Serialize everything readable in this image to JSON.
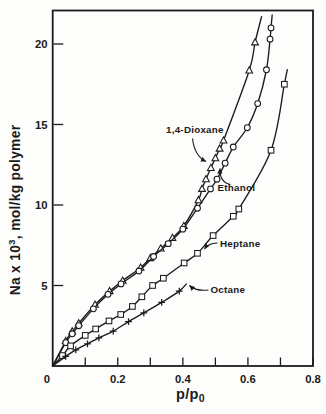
{
  "figure": {
    "background": "#fdfdfc",
    "ink": "#1b1b1b"
  },
  "chart_data": {
    "type": "line",
    "title": "",
    "xlabel": "p/p0",
    "ylabel": "Na x 10^3, mol/kg polymer",
    "xlim": [
      0,
      0.8
    ],
    "ylim": [
      0,
      22.08
    ],
    "grid": false,
    "framed": true,
    "legend_position": "in-plot annotations with arrows",
    "x_axis": {
      "title_base": "p/p",
      "title_sub": "0",
      "zero_label": "0",
      "ticks": [
        {
          "v": 0.1
        },
        {
          "v": 0.2,
          "label": "0.2"
        },
        {
          "v": 0.3
        },
        {
          "v": 0.4,
          "label": "0.4"
        },
        {
          "v": 0.5
        },
        {
          "v": 0.6,
          "label": "0.6"
        },
        {
          "v": 0.7
        },
        {
          "v": 0.8,
          "label": "0.8"
        }
      ]
    },
    "y_axis": {
      "title_base": "Na x 10",
      "title_sup": "3",
      "title_rest": ", mol/kg polymer",
      "ticks": [
        {
          "v": 5,
          "label": "5"
        },
        {
          "v": 10,
          "label": "10"
        },
        {
          "v": 15,
          "label": "15"
        },
        {
          "v": 20,
          "label": "20"
        }
      ]
    },
    "series": [
      {
        "name": "1,4-Dioxane",
        "marker": "triangle",
        "curve_start": [
          0,
          0
        ],
        "curve_end": [
          0.642,
          21.7
        ],
        "points": [
          [
            0.04,
            1.55
          ],
          [
            0.06,
            2.15
          ],
          [
            0.08,
            2.65
          ],
          [
            0.13,
            3.8
          ],
          [
            0.175,
            4.65
          ],
          [
            0.215,
            5.3
          ],
          [
            0.27,
            6.1
          ],
          [
            0.3,
            6.7
          ],
          [
            0.332,
            7.3
          ],
          [
            0.368,
            7.95
          ],
          [
            0.403,
            8.7
          ],
          [
            0.448,
            10.3
          ],
          [
            0.459,
            11.0
          ],
          [
            0.471,
            11.6
          ],
          [
            0.486,
            12.3
          ],
          [
            0.5,
            12.9
          ],
          [
            0.513,
            13.5
          ],
          [
            0.525,
            14.0
          ],
          [
            0.604,
            18.35
          ],
          [
            0.622,
            20.1
          ]
        ]
      },
      {
        "name": "Ethanol",
        "marker": "circle",
        "curve_start": [
          0,
          0
        ],
        "curve_end": [
          0.6745,
          21.8
        ],
        "points": [
          [
            0.04,
            1.45
          ],
          [
            0.06,
            2.0
          ],
          [
            0.08,
            2.5
          ],
          [
            0.125,
            3.55
          ],
          [
            0.17,
            4.45
          ],
          [
            0.21,
            5.1
          ],
          [
            0.265,
            5.9
          ],
          [
            0.31,
            6.8
          ],
          [
            0.355,
            7.6
          ],
          [
            0.4,
            8.5
          ],
          [
            0.445,
            9.8
          ],
          [
            0.485,
            11.0
          ],
          [
            0.505,
            11.6
          ],
          [
            0.53,
            12.6
          ],
          [
            0.555,
            13.6
          ],
          [
            0.598,
            14.8
          ],
          [
            0.63,
            16.3
          ],
          [
            0.657,
            18.4
          ],
          [
            0.668,
            20.3
          ],
          [
            0.671,
            21.0
          ]
        ]
      },
      {
        "name": "Heptane",
        "marker": "square",
        "curve_start": [
          0,
          0
        ],
        "curve_end": [
          0.721,
          18.4
        ],
        "points": [
          [
            0.03,
            0.65
          ],
          [
            0.055,
            1.25
          ],
          [
            0.1,
            1.9
          ],
          [
            0.132,
            2.3
          ],
          [
            0.173,
            2.8
          ],
          [
            0.209,
            3.2
          ],
          [
            0.245,
            3.7
          ],
          [
            0.274,
            4.3
          ],
          [
            0.307,
            5.0
          ],
          [
            0.34,
            5.45
          ],
          [
            0.404,
            6.4
          ],
          [
            0.445,
            7.0
          ],
          [
            0.493,
            8.1
          ],
          [
            0.555,
            9.3
          ],
          [
            0.572,
            9.75
          ],
          [
            0.671,
            13.4
          ],
          [
            0.712,
            17.5
          ]
        ]
      },
      {
        "name": "Octane",
        "marker": "plus",
        "curve_start": [
          0,
          0
        ],
        "curve_end": [
          0.411,
          5.1
        ],
        "points": [
          [
            0.04,
            0.6
          ],
          [
            0.071,
            1.0
          ],
          [
            0.107,
            1.38
          ],
          [
            0.142,
            1.75
          ],
          [
            0.186,
            2.17
          ],
          [
            0.233,
            2.76
          ],
          [
            0.28,
            3.3
          ],
          [
            0.335,
            3.95
          ],
          [
            0.389,
            4.65
          ]
        ]
      }
    ],
    "annotations": [
      {
        "text": "1,4-Dioxane",
        "x": 166,
        "y": 133,
        "arrow": {
          "from": [
            192.5,
            138.5
          ],
          "ctrl": [
            194.5,
            156
          ],
          "to": [
            206,
            161.5
          ]
        }
      },
      {
        "text": "Ethanol",
        "x": 217.5,
        "y": 190.5,
        "arrow": {
          "from": [
            230.5,
            184.5
          ],
          "ctrl": [
            219.5,
            182.5
          ],
          "to": [
            220,
            168.5
          ]
        }
      },
      {
        "text": "Heptane",
        "x": 220,
        "y": 246.5,
        "arrow": {
          "from": [
            217.5,
            243
          ],
          "ctrl": [
            208,
            243.5
          ],
          "to": [
            204.5,
            249
          ]
        }
      },
      {
        "text": "Octane",
        "x": 210.5,
        "y": 293,
        "arrow": {
          "from": [
            208.5,
            290
          ],
          "ctrl": [
            196,
            291.5
          ],
          "to": [
            189.5,
            285.5
          ]
        }
      }
    ]
  }
}
